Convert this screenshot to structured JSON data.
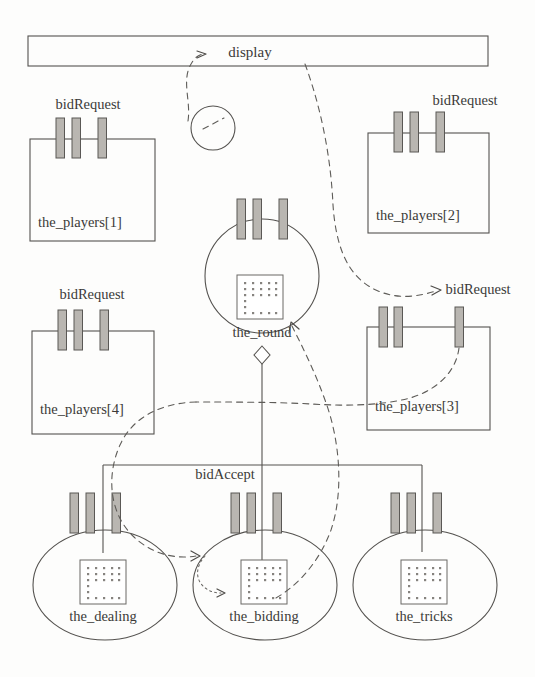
{
  "diagram": {
    "title": "display",
    "kind": "object-collaboration-diagram",
    "colors": {
      "outline": "#54524f",
      "port_fill": "#b9b6b1",
      "message_link": "#5e5c58",
      "text": "#3b3a38",
      "background": "#fdfdfc"
    },
    "display_bar": {
      "label": "display",
      "shape": "rectangle"
    },
    "free_circle": {
      "label": "",
      "shape": "circle"
    },
    "players": [
      {
        "id": "player-1",
        "label": "the_players[1]",
        "message_label": "bidRequest",
        "shape": "rectangle",
        "port_count": 3
      },
      {
        "id": "player-2",
        "label": "the_players[2]",
        "message_label": "bidRequest",
        "shape": "rectangle",
        "port_count": 3
      },
      {
        "id": "player-4",
        "label": "the_players[4]",
        "message_label": "bidRequest",
        "shape": "rectangle",
        "port_count": 3
      },
      {
        "id": "player-3",
        "label": "the_players[3]",
        "message_label": "bidRequest",
        "shape": "rectangle",
        "port_count": 3
      }
    ],
    "round": {
      "id": "the-round",
      "label": "the_round",
      "shape": "circle",
      "port_count": 3,
      "has_icon": true,
      "aggregation_marker": "diamond"
    },
    "phases": [
      {
        "id": "the-dealing",
        "label": "the_dealing",
        "shape": "ellipse",
        "port_count": 3,
        "has_icon": true
      },
      {
        "id": "the-bidding",
        "label": "the_bidding",
        "shape": "ellipse",
        "port_count": 3,
        "has_icon": true
      },
      {
        "id": "the-tricks",
        "label": "the_tricks",
        "shape": "ellipse",
        "port_count": 3,
        "has_icon": true
      }
    ],
    "messages": [
      {
        "id": "msg-bid-accept",
        "label": "bidAccept"
      }
    ],
    "icon_names": {
      "port": "port-bar-icon",
      "state_table": "dot-grid-icon",
      "aggregation": "diamond-icon",
      "message_arrow": "arrow-head-icon"
    }
  }
}
